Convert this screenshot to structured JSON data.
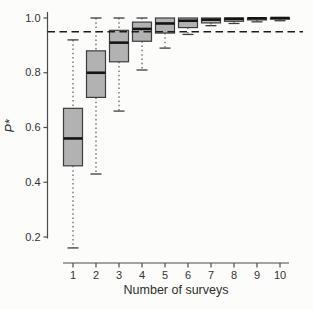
{
  "figure": {
    "background": "#fcfcfb",
    "axis_color": "#4b4b4b",
    "tick_text_color": "#333333",
    "box_fill": "#b2b2b2",
    "box_stroke": "#3d3d3d",
    "median_color": "#141414",
    "whisker_color": "#4b4b4b",
    "ref_line_color": "#1c1c1c"
  },
  "chart_data": {
    "type": "boxplot",
    "title": "",
    "xlabel": "Number of surveys",
    "ylabel": "P*",
    "x_categories": [
      "1",
      "2",
      "3",
      "4",
      "5",
      "6",
      "7",
      "8",
      "9",
      "10"
    ],
    "y_tick_labels": [
      "1.0",
      "0.8",
      "0.6",
      "0.4",
      "0.2"
    ],
    "y_tick_values": [
      1.0,
      0.8,
      0.6,
      0.4,
      0.2
    ],
    "ylim": [
      0.14,
      1.01
    ],
    "grid": "off",
    "legend": "none",
    "reference_line": {
      "value": 0.95,
      "style": "dashed"
    },
    "boxes": [
      {
        "surveys": 1,
        "whisker_low": 0.16,
        "q1": 0.46,
        "median": 0.56,
        "q3": 0.67,
        "whisker_high": 0.92
      },
      {
        "surveys": 2,
        "whisker_low": 0.43,
        "q1": 0.71,
        "median": 0.8,
        "q3": 0.88,
        "whisker_high": 1.0
      },
      {
        "surveys": 3,
        "whisker_low": 0.66,
        "q1": 0.84,
        "median": 0.91,
        "q3": 0.955,
        "whisker_high": 1.0
      },
      {
        "surveys": 4,
        "whisker_low": 0.81,
        "q1": 0.915,
        "median": 0.96,
        "q3": 0.985,
        "whisker_high": 1.0
      },
      {
        "surveys": 5,
        "whisker_low": 0.89,
        "q1": 0.945,
        "median": 0.98,
        "q3": 1.0,
        "whisker_high": 1.0
      },
      {
        "surveys": 6,
        "whisker_low": 0.94,
        "q1": 0.965,
        "median": 0.99,
        "q3": 1.0,
        "whisker_high": 1.0
      },
      {
        "surveys": 7,
        "whisker_low": 0.972,
        "q1": 0.982,
        "median": 0.994,
        "q3": 1.0,
        "whisker_high": 1.0
      },
      {
        "surveys": 8,
        "whisker_low": 0.98,
        "q1": 0.988,
        "median": 0.997,
        "q3": 1.0,
        "whisker_high": 1.0
      },
      {
        "surveys": 9,
        "whisker_low": 0.986,
        "q1": 0.993,
        "median": 0.999,
        "q3": 1.0,
        "whisker_high": 1.0
      },
      {
        "surveys": 10,
        "whisker_low": 0.99,
        "q1": 0.996,
        "median": 1.0,
        "q3": 1.0,
        "whisker_high": 1.0
      }
    ]
  }
}
